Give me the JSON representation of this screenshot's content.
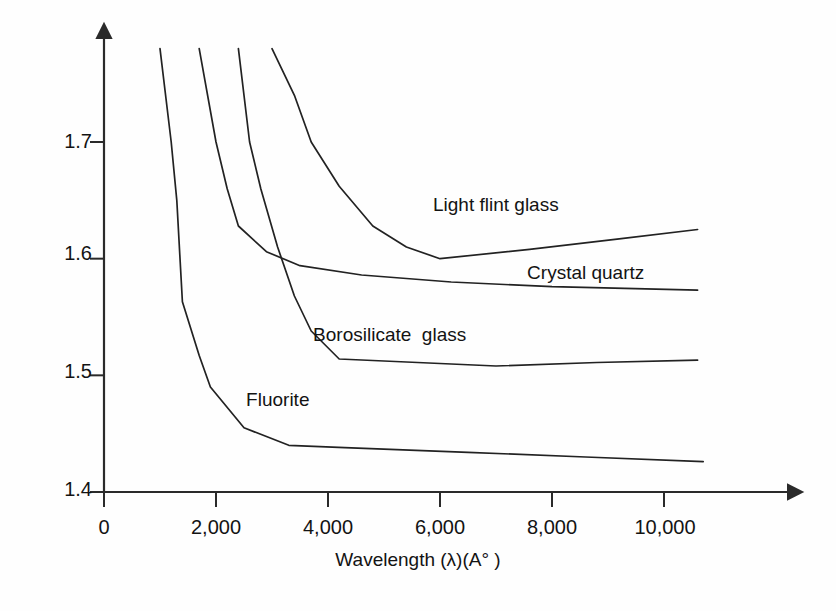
{
  "chart_data": {
    "type": "line",
    "title": "",
    "xlabel": "Wavelength (λ)(A° )",
    "ylabel": "",
    "xlim": [
      0,
      11600
    ],
    "ylim": [
      1.4,
      1.78
    ],
    "xticks": [
      0,
      2000,
      4000,
      6000,
      8000,
      10000
    ],
    "xticklabels": [
      "0",
      "2,000",
      "4,000",
      "6,000",
      "8,000",
      "10,000"
    ],
    "yticks": [
      1.4,
      1.5,
      1.6,
      1.7
    ],
    "yticklabels": [
      "1.4",
      "1.5",
      "1.6",
      "1.7"
    ],
    "grid": false,
    "legend_position": "inline-annotations",
    "line_color": "#222222",
    "series": [
      {
        "name": "Light flint glass",
        "label_x": 7000,
        "label_y": 1.645,
        "points": [
          [
            3000,
            1.78
          ],
          [
            3400,
            1.74
          ],
          [
            3700,
            1.7
          ],
          [
            4200,
            1.662
          ],
          [
            4800,
            1.628
          ],
          [
            5400,
            1.61
          ],
          [
            6000,
            1.6
          ],
          [
            7600,
            1.608
          ],
          [
            9200,
            1.617
          ],
          [
            10600,
            1.625
          ]
        ]
      },
      {
        "name": "Crystal quartz",
        "label_x": 8600,
        "label_y": 1.587,
        "points": [
          [
            1700,
            1.78
          ],
          [
            2000,
            1.7
          ],
          [
            2200,
            1.66
          ],
          [
            2400,
            1.628
          ],
          [
            2900,
            1.606
          ],
          [
            3500,
            1.594
          ],
          [
            4600,
            1.586
          ],
          [
            6200,
            1.58
          ],
          [
            8000,
            1.576
          ],
          [
            10600,
            1.573
          ]
        ]
      },
      {
        "name": "Borosilicate  glass",
        "label_x": 5100,
        "label_y": 1.534,
        "points": [
          [
            2400,
            1.78
          ],
          [
            2600,
            1.7
          ],
          [
            2800,
            1.66
          ],
          [
            3100,
            1.61
          ],
          [
            3400,
            1.568
          ],
          [
            3700,
            1.538
          ],
          [
            4200,
            1.514
          ],
          [
            5600,
            1.511
          ],
          [
            7000,
            1.508
          ],
          [
            8800,
            1.511
          ],
          [
            10600,
            1.513
          ]
        ]
      },
      {
        "name": "Fluorite",
        "label_x": 3100,
        "label_y": 1.478,
        "points": [
          [
            1000,
            1.78
          ],
          [
            1200,
            1.7
          ],
          [
            1300,
            1.65
          ],
          [
            1400,
            1.563
          ],
          [
            1700,
            1.517
          ],
          [
            1900,
            1.49
          ],
          [
            2500,
            1.455
          ],
          [
            3300,
            1.44
          ],
          [
            4300,
            1.438
          ],
          [
            6500,
            1.434
          ],
          [
            8600,
            1.43
          ],
          [
            10700,
            1.426
          ]
        ]
      }
    ]
  },
  "axes": {
    "x_axis_name": "x-axis",
    "y_axis_name": "y-axis",
    "arrow_x_label": "x-axis-arrow",
    "arrow_y_label": "y-axis-arrow"
  }
}
